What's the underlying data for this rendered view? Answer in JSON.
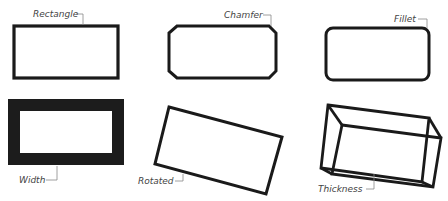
{
  "diagram": {
    "panels": [
      {
        "id": "rectangle",
        "label": "Rectangle"
      },
      {
        "id": "chamfer",
        "label": "Chamfer"
      },
      {
        "id": "fillet",
        "label": "Fillet"
      },
      {
        "id": "width",
        "label": "Width"
      },
      {
        "id": "rotated",
        "label": "Rotated"
      },
      {
        "id": "thickness",
        "label": "Thickness"
      }
    ],
    "colors": {
      "stroke": "#1a1a1a",
      "label": "#444444",
      "leader": "#888888",
      "background": "#ffffff"
    }
  }
}
